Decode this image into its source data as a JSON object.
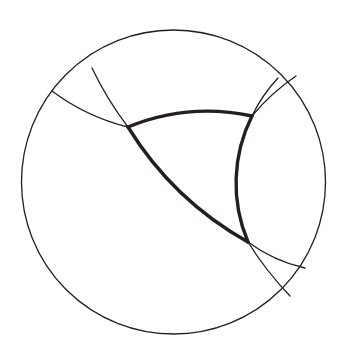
{
  "figure": {
    "background_color": "#ffffff",
    "stroke_color": "#231f20",
    "thin_stroke_width": 1.3,
    "thick_stroke_width": 3.4
  },
  "chart_data": {
    "type": "diagram",
    "title": "Hyperbolic triangle in the Poincare disk",
    "xlabel": "",
    "ylabel": "",
    "coordinate_space": "screen pixels, origin top-left, 344 x 356",
    "boundary_circle": {
      "name": "ideal-boundary-circle",
      "cx": 173.5,
      "cy": 182.0,
      "r": 152.0,
      "stroke": "#231f20",
      "stroke_width": 1.3,
      "fill": "none"
    },
    "vertices": [
      {
        "label": "A",
        "x": 128.0,
        "y": 127.0,
        "position": "upper-left"
      },
      {
        "label": "B",
        "x": 252.0,
        "y": 116.0,
        "position": "upper-right"
      },
      {
        "label": "C",
        "x": 248.0,
        "y": 242.0,
        "position": "lower-right"
      }
    ],
    "geodesics": [
      {
        "name": "geodesic-top",
        "through_vertices": [
          "A",
          "B"
        ],
        "ideal_endpoints": [
          {
            "x": 52.0,
            "y": 91.0
          },
          {
            "x": 296.0,
            "y": 76.0
          }
        ],
        "arc_radius": 210,
        "sweep": 1,
        "curvature": "bulges upward (concave toward disk center)"
      },
      {
        "name": "geodesic-left",
        "through_vertices": [
          "A",
          "C"
        ],
        "ideal_endpoints": [
          {
            "x": 92.0,
            "y": 68.0
          },
          {
            "x": 290.0,
            "y": 296.0
          }
        ],
        "arc_radius": 330,
        "sweep": 0,
        "curvature": "bulges toward upper-right"
      },
      {
        "name": "geodesic-right",
        "through_vertices": [
          "B",
          "C"
        ],
        "ideal_endpoints": [
          {
            "x": 278.0,
            "y": 78.0
          },
          {
            "x": 305.0,
            "y": 268.0
          }
        ],
        "arc_radius": 150,
        "sweep": 0,
        "curvature": "bulges toward the right boundary"
      }
    ],
    "triangle_sides": [
      {
        "name": "triangle-side-ab",
        "from": "A",
        "to": "B",
        "radius": 210,
        "large_arc": 0,
        "sweep": 1,
        "stroke_width": 3.4
      },
      {
        "name": "triangle-side-ac",
        "from": "A",
        "to": "C",
        "radius": 330,
        "large_arc": 0,
        "sweep": 0,
        "stroke_width": 3.4
      },
      {
        "name": "triangle-side-bc",
        "from": "B",
        "to": "C",
        "radius": 150,
        "large_arc": 0,
        "sweep": 0,
        "stroke_width": 3.4
      }
    ],
    "arc_tails": [
      {
        "name": "tail-top-left",
        "from_vertex": "A",
        "to_ideal_point": {
          "x": 52.0,
          "y": 91.0
        },
        "radius": 210,
        "sweep": 1
      },
      {
        "name": "tail-top-right",
        "from_vertex": "B",
        "to_ideal_point": {
          "x": 296.0,
          "y": 76.0
        },
        "radius": 210,
        "sweep": 1
      },
      {
        "name": "tail-left-upper",
        "from_vertex": "A",
        "to_ideal_point": {
          "x": 92.0,
          "y": 68.0
        },
        "radius": 330,
        "sweep": 1
      },
      {
        "name": "tail-left-lower",
        "from_vertex": "C",
        "to_ideal_point": {
          "x": 290.0,
          "y": 296.0
        },
        "radius": 330,
        "sweep": 0
      },
      {
        "name": "tail-right-upper",
        "from_vertex": "B",
        "to_ideal_point": {
          "x": 278.0,
          "y": 78.0
        },
        "radius": 150,
        "sweep": 1
      },
      {
        "name": "tail-right-lower",
        "from_vertex": "C",
        "to_ideal_point": {
          "x": 305.0,
          "y": 268.0
        },
        "radius": 150,
        "sweep": 0
      }
    ],
    "legend": [],
    "annotations": [],
    "grid": false
  }
}
